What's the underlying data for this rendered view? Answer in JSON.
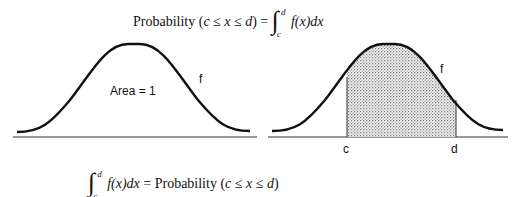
{
  "top_formula": {
    "prefix": "Probability (",
    "c": "c",
    "le1": " ≤ ",
    "x": "x",
    "le2": " ≤ ",
    "d": "d",
    "suffix": ") = ",
    "integral": "∫",
    "upper": "d",
    "lower": "c",
    "integrand": "f(x)dx"
  },
  "left_panel": {
    "area_label": "Area = 1",
    "curve_label": "f"
  },
  "right_panel": {
    "curve_label": "f",
    "c_label": "c",
    "d_label": "d"
  },
  "bottom_formula": {
    "integral": "∫",
    "upper": "d",
    "lower": "c",
    "integrand": "f(x)dx",
    "eq": " = Probability (",
    "c": "c",
    "le1": " ≤ ",
    "x": "x",
    "le2": " ≤ ",
    "d": "d",
    "close": ")"
  },
  "colors": {
    "stroke": "#111111",
    "shade_dots": "#777777"
  }
}
